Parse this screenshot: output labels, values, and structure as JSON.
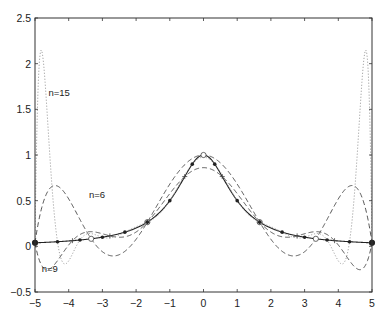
{
  "chart_data": {
    "type": "line",
    "title": "",
    "xlabel": "",
    "ylabel": "",
    "xlim": [
      -5,
      5
    ],
    "ylim": [
      -0.5,
      2.5
    ],
    "grid": false,
    "legend": "none (inline annotations)",
    "x_ticks": [
      -5,
      -4,
      -3,
      -2,
      -1,
      0,
      1,
      2,
      3,
      4,
      5
    ],
    "x_tick_labels": [
      "−5",
      "−4",
      "−3",
      "−2",
      "−1",
      "0",
      "1",
      "2",
      "3",
      "4",
      "5"
    ],
    "y_ticks": [
      -0.5,
      0,
      0.5,
      1,
      1.5,
      2,
      2.5
    ],
    "y_tick_labels": [
      "−0.5",
      "0",
      "0.5",
      "1",
      "1.5",
      "2",
      "2.5"
    ],
    "function": "f(x) = 1/(1+x^2)",
    "series": [
      {
        "name": "f(x)",
        "style": "solid",
        "marker": "dot",
        "nodes": 0,
        "x": [
          -5,
          -4,
          -3,
          -2,
          -1,
          0,
          1,
          2,
          3,
          4,
          5
        ],
        "values": [
          0.038,
          0.059,
          0.1,
          0.2,
          0.5,
          1.0,
          0.5,
          0.2,
          0.1,
          0.059,
          0.038
        ]
      },
      {
        "name": "n=6",
        "style": "dashed",
        "marker": "circle",
        "nodes": 6,
        "x": [
          -5,
          -4.5,
          -4,
          -3,
          -2,
          -1,
          0,
          1,
          2,
          3,
          4,
          4.5,
          5
        ],
        "values": [
          0.038,
          0.67,
          0.45,
          -0.06,
          0.05,
          0.55,
          0.85,
          0.55,
          0.05,
          -0.06,
          0.45,
          0.67,
          0.038
        ]
      },
      {
        "name": "n=9",
        "style": "dashed",
        "marker": "plus",
        "nodes": 9,
        "x": [
          -5,
          -4.7,
          -4,
          -3,
          -2,
          -1,
          0,
          1,
          2,
          3,
          4,
          4.7,
          5
        ],
        "values": [
          0.038,
          -0.25,
          -0.1,
          0.12,
          0.16,
          0.5,
          1.0,
          0.5,
          0.16,
          0.12,
          -0.1,
          -0.25,
          0.038
        ]
      },
      {
        "name": "n=15",
        "style": "dotted",
        "marker": "none",
        "nodes": 15,
        "x": [
          -5,
          -4.8,
          -4.3,
          -4,
          -3,
          -2,
          -1,
          0,
          1,
          2,
          3,
          4,
          4.3,
          4.8,
          5
        ],
        "values": [
          0.038,
          2.15,
          0.3,
          -0.2,
          0.15,
          0.2,
          0.5,
          1.0,
          0.5,
          0.2,
          0.15,
          -0.2,
          0.3,
          2.15,
          0.038
        ]
      }
    ],
    "annotations": [
      {
        "text": "n=15",
        "x": -4.6,
        "y": 1.65
      },
      {
        "text": "n=6",
        "x": -3.4,
        "y": 0.53
      },
      {
        "text": "n=9",
        "x": -4.8,
        "y": -0.28
      }
    ],
    "colors": {
      "axis": "#333333",
      "solid": "#222222",
      "dashed": "#444444",
      "dotted": "#9a9a9a"
    }
  }
}
